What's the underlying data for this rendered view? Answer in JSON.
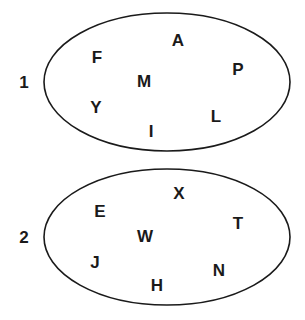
{
  "sets": [
    {
      "label": "1",
      "label_pos": [
        24,
        82
      ],
      "ellipse": {
        "cx": 167,
        "cy": 82,
        "rx": 123,
        "ry": 69
      },
      "members": [
        {
          "letter": "A",
          "x": 178,
          "y": 40
        },
        {
          "letter": "F",
          "x": 97,
          "y": 57
        },
        {
          "letter": "P",
          "x": 238,
          "y": 69
        },
        {
          "letter": "M",
          "x": 144,
          "y": 81
        },
        {
          "letter": "Y",
          "x": 96,
          "y": 107
        },
        {
          "letter": "L",
          "x": 216,
          "y": 116
        },
        {
          "letter": "I",
          "x": 151,
          "y": 131
        }
      ]
    },
    {
      "label": "2",
      "label_pos": [
        24,
        237
      ],
      "ellipse": {
        "cx": 167,
        "cy": 237,
        "rx": 123,
        "ry": 68
      },
      "members": [
        {
          "letter": "X",
          "x": 179,
          "y": 193
        },
        {
          "letter": "E",
          "x": 100,
          "y": 211
        },
        {
          "letter": "T",
          "x": 238,
          "y": 223
        },
        {
          "letter": "W",
          "x": 145,
          "y": 236
        },
        {
          "letter": "J",
          "x": 95,
          "y": 262
        },
        {
          "letter": "N",
          "x": 219,
          "y": 270
        },
        {
          "letter": "H",
          "x": 157,
          "y": 285
        }
      ]
    }
  ],
  "colors": {
    "stroke": "#1a1a1a",
    "text": "#1a1a1a",
    "background": "#ffffff"
  }
}
